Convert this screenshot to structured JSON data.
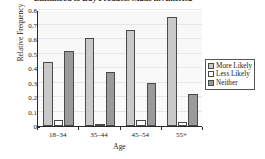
{
  "chart_data": {
    "type": "bar",
    "title": "Likelihood to Buy Products Made in America",
    "xlabel": "Age",
    "ylabel": "Relative Frequency",
    "categories": [
      "18–34",
      "35–44",
      "45–54",
      "55+"
    ],
    "series": [
      {
        "name": "More Likely",
        "values": [
          0.44,
          0.61,
          0.66,
          0.75
        ],
        "color": "#c9c9c9"
      },
      {
        "name": "Less Likely",
        "values": [
          0.04,
          0.01,
          0.04,
          0.03
        ],
        "color": "#ffffff"
      },
      {
        "name": "Neither",
        "values": [
          0.52,
          0.37,
          0.3,
          0.22
        ],
        "color": "#9a9a9a"
      }
    ],
    "ylim": [
      0,
      0.8
    ],
    "yticks": [
      "0",
      "0.1",
      "0.2",
      "0.3",
      "0.4",
      "0.5",
      "0.6",
      "0.7",
      "0.8"
    ],
    "ytick_values": [
      0,
      0.1,
      0.2,
      0.3,
      0.4,
      0.5,
      0.6,
      0.7,
      0.8
    ],
    "grid": true,
    "legend_position": "right"
  },
  "legend": {
    "entries": [
      {
        "label": "More Likely"
      },
      {
        "label": "Less Likely"
      },
      {
        "label": "Neither"
      }
    ]
  }
}
